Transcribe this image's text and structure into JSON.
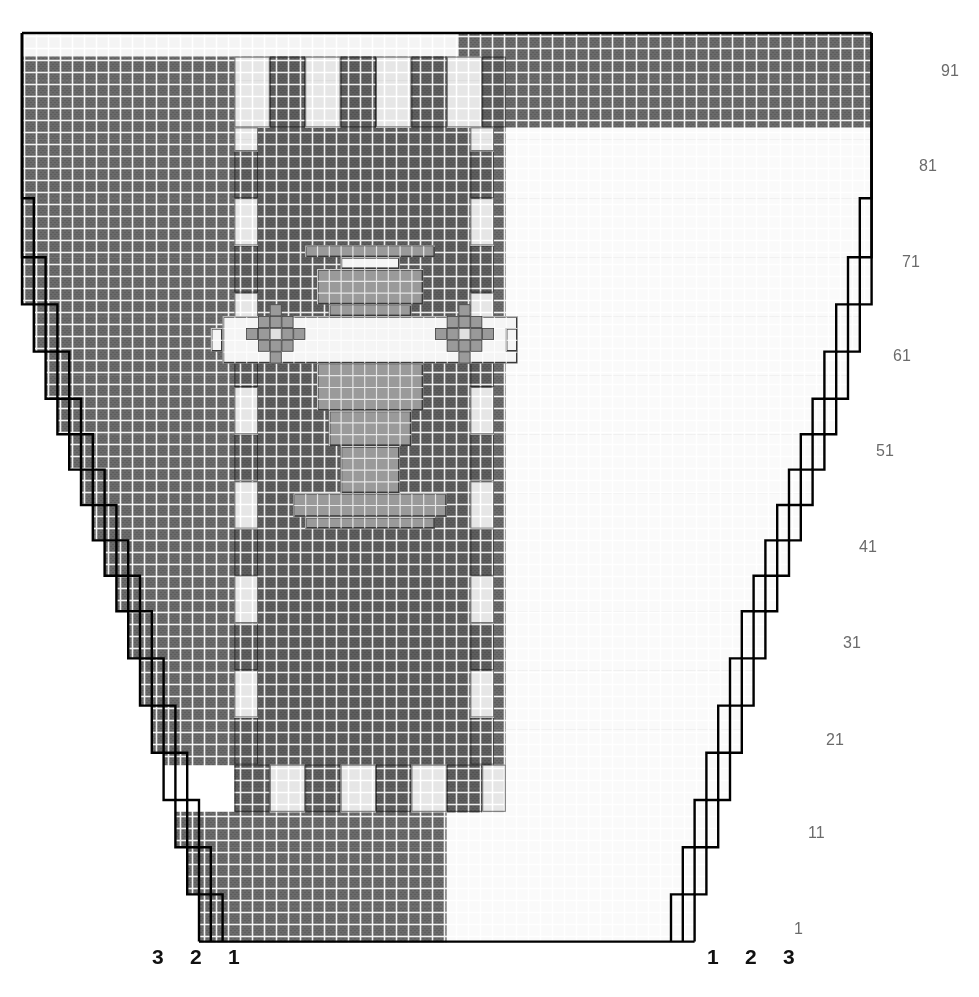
{
  "title": "SLEEVES",
  "colors": {
    "background": "#ffffff",
    "light": "#f2f2f2",
    "light_grid": "#ffffff",
    "mid_light": "#dcdcdc",
    "dark": "#666666",
    "dark2": "#585858",
    "outline": "#000000",
    "row_label": "#6b6b6b",
    "size_label": "#111111"
  },
  "grid": {
    "cell_px": 11.8,
    "columns": 72,
    "rows": 77,
    "origin_x": 22,
    "origin_y": 33
  },
  "row_labels": [
    {
      "text": "91",
      "x": 941,
      "y": 62
    },
    {
      "text": "81",
      "x": 919,
      "y": 157
    },
    {
      "text": "71",
      "x": 902,
      "y": 253
    },
    {
      "text": "61",
      "x": 893,
      "y": 347
    },
    {
      "text": "51",
      "x": 876,
      "y": 442
    },
    {
      "text": "41",
      "x": 859,
      "y": 538
    },
    {
      "text": "31",
      "x": 843,
      "y": 634
    },
    {
      "text": "21",
      "x": 826,
      "y": 731
    },
    {
      "text": "11",
      "x": 808,
      "y": 824
    },
    {
      "text": "1",
      "x": 794,
      "y": 920
    }
  ],
  "size_labels_left": [
    {
      "text": "3",
      "x": 152,
      "y": 945
    },
    {
      "text": "2",
      "x": 190,
      "y": 945
    },
    {
      "text": "1",
      "x": 228,
      "y": 945
    }
  ],
  "size_labels_right": [
    {
      "text": "1",
      "x": 707,
      "y": 945
    },
    {
      "text": "2",
      "x": 745,
      "y": 945
    },
    {
      "text": "3",
      "x": 783,
      "y": 945
    }
  ],
  "chart_data": {
    "type": "heatmap",
    "title": "SLEEVES",
    "xlabel": "",
    "ylabel": "",
    "legend": [
      "1",
      "2",
      "3"
    ],
    "legend_position": "bottom",
    "grid": true,
    "axis_rows": [
      1,
      11,
      21,
      31,
      41,
      51,
      61,
      71,
      81,
      91
    ],
    "axis_row_range": [
      1,
      97
    ],
    "axis_sizes_left": [
      3,
      2,
      1
    ],
    "axis_sizes_right": [
      1,
      2,
      3
    ],
    "cell_values_note": "0 = light (background / purl), 1 = dark (colour / knit)",
    "regions": [
      {
        "name": "top-band-left",
        "value": 0,
        "cols": [
          0,
          37
        ],
        "rows": [
          89,
          97
        ]
      },
      {
        "name": "top-band-right",
        "value": 1,
        "cols": [
          37,
          72
        ],
        "rows": [
          89,
          97
        ]
      },
      {
        "name": "checker-border-top",
        "value": "alternating",
        "rows": [
          83,
          89
        ]
      },
      {
        "name": "body-field",
        "value": 1,
        "cols": [
          18,
          40
        ],
        "rows": [
          15,
          83
        ]
      },
      {
        "name": "side-column-left",
        "value": "alternating",
        "cols": [
          17,
          18
        ],
        "rows": [
          15,
          83
        ]
      },
      {
        "name": "side-column-right",
        "value": "alternating",
        "cols": [
          40,
          41
        ],
        "rows": [
          15,
          83
        ]
      },
      {
        "name": "checker-border-bottom",
        "value": "alternating",
        "rows": [
          11,
          15
        ]
      },
      {
        "name": "bottom-left",
        "value": 1,
        "cols": [
          0,
          36
        ],
        "rows": [
          1,
          11
        ]
      },
      {
        "name": "bottom-right",
        "value": 0,
        "cols": [
          36,
          72
        ],
        "rows": [
          1,
          11
        ]
      }
    ],
    "motif": {
      "name": "central-symmetric-motif",
      "center_col": 29,
      "center_row": 49,
      "elements": [
        "top-bar",
        "upper-stem",
        "cross-beam",
        "left-rosette",
        "right-rosette",
        "lower-stem",
        "foot"
      ]
    }
  }
}
